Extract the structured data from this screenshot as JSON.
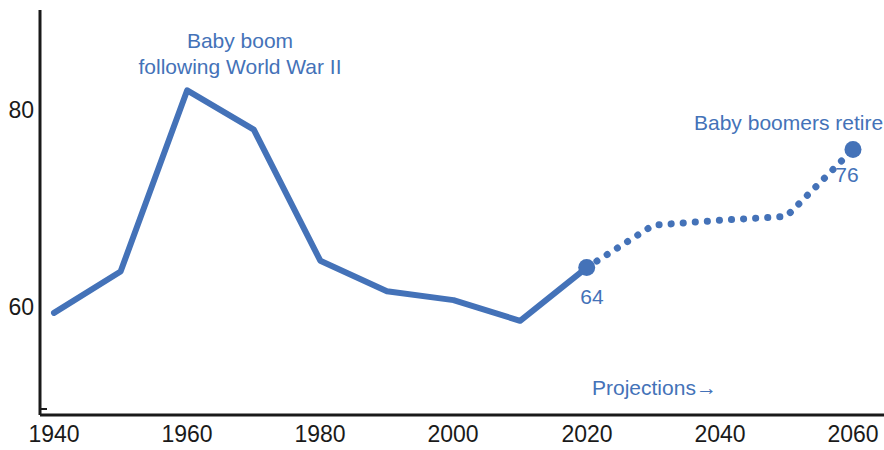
{
  "chart_data": {
    "type": "line",
    "title": "",
    "subtitle": "",
    "xlabel": "",
    "ylabel": "",
    "xlim": [
      1935,
      2065
    ],
    "ylim": [
      50,
      85
    ],
    "grid": false,
    "legend_position": "none",
    "x_ticks": [
      "1940",
      "1960",
      "1980",
      "2000",
      "2020",
      "2040",
      "2060"
    ],
    "y_ticks": [
      "60",
      "80"
    ],
    "line_color": "#4472b8",
    "axis_color": "#1a1a1a",
    "series": [
      {
        "name": "Historical",
        "style": "solid",
        "x": [
          1940,
          1950,
          1960,
          1970,
          1980,
          1990,
          2000,
          2010,
          2020
        ],
        "values": [
          59.4,
          63.6,
          82.0,
          78.0,
          64.7,
          61.6,
          60.7,
          58.6,
          64.0
        ]
      },
      {
        "name": "Projections",
        "style": "dotted",
        "x": [
          2020,
          2030,
          2040,
          2050,
          2060
        ],
        "values": [
          64.0,
          68.3,
          68.8,
          69.2,
          76.0
        ]
      }
    ],
    "markers": [
      {
        "x": 2020,
        "value": 64,
        "label": "64"
      },
      {
        "x": 2060,
        "value": 76,
        "label": "76"
      }
    ],
    "annotations": [
      {
        "id": "baby-boom",
        "line1": "Baby boom",
        "line2": "following World War II"
      },
      {
        "id": "boomers-retire",
        "text": "Baby boomers retire"
      },
      {
        "id": "projections",
        "text": "Projections→"
      }
    ]
  }
}
